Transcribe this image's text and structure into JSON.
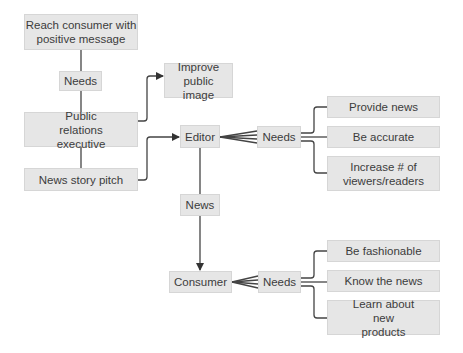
{
  "diagram": {
    "type": "flow diagram",
    "nodes": {
      "reach_consumer": "Reach consumer with positive message",
      "needs_top": "Needs",
      "pr_executive": "Public relations executive",
      "news_story_pitch": "News story pitch",
      "improve_image": "Improve public image",
      "editor": "Editor",
      "editor_needs": "Needs",
      "provide_news": "Provide news",
      "be_accurate": "Be accurate",
      "increase_viewers": "Increase # of viewers/readers",
      "news": "News",
      "consumer": "Consumer",
      "consumer_needs": "Needs",
      "be_fashionable": "Be fashionable",
      "know_news": "Know the news",
      "learn_products": "Learn about new products"
    },
    "edges": [
      {
        "from": "Reach consumer with positive message",
        "to": "Needs",
        "style": "line"
      },
      {
        "from": "Needs",
        "to": "Public relations executive",
        "style": "line"
      },
      {
        "from": "Public relations executive",
        "to": "News story pitch",
        "style": "line"
      },
      {
        "from": "Public relations executive",
        "to": "Improve public image",
        "style": "arrow"
      },
      {
        "from": "News story pitch",
        "to": "Editor",
        "style": "arrow"
      },
      {
        "from": "Editor",
        "to": "Needs",
        "style": "fan"
      },
      {
        "from": "Needs",
        "to": [
          "Provide news",
          "Be accurate",
          "Increase # of viewers/readers"
        ],
        "style": "bracket"
      },
      {
        "from": "Editor",
        "to": "News",
        "style": "line"
      },
      {
        "from": "News",
        "to": "Consumer",
        "style": "arrow"
      },
      {
        "from": "Consumer",
        "to": "Needs",
        "style": "fan"
      },
      {
        "from": "Needs",
        "to": [
          "Be fashionable",
          "Know the news",
          "Learn about new products"
        ],
        "style": "bracket"
      }
    ],
    "colors": {
      "box_fill": "#e6e6e6",
      "box_border": "#d6d6d6",
      "line": "#333333",
      "text": "#3c3c3c"
    }
  }
}
